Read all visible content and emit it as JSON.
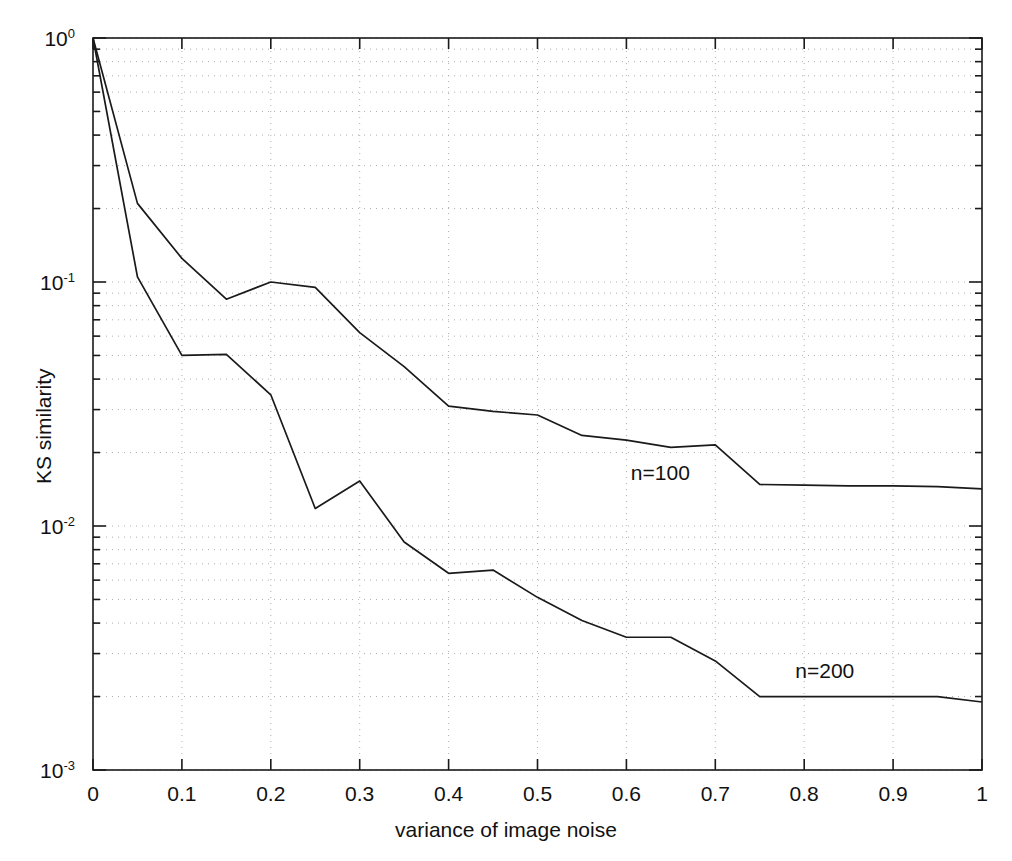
{
  "chart_data": {
    "type": "line",
    "title": "",
    "xlabel": "variance of image noise",
    "ylabel": "KS similarity",
    "xscale": "linear",
    "yscale": "log",
    "xlim": [
      0,
      1
    ],
    "ylim": [
      0.001,
      1
    ],
    "grid": "dotted minor and major log grid",
    "legend_position": "inline annotations on curves",
    "xticks": [
      "0",
      "0.1",
      "0.2",
      "0.3",
      "0.4",
      "0.5",
      "0.6",
      "0.7",
      "0.8",
      "0.9",
      "1"
    ],
    "xtick_values": [
      0,
      0.1,
      0.2,
      0.3,
      0.4,
      0.5,
      0.6,
      0.7,
      0.8,
      0.9,
      1
    ],
    "yticks": [
      "10^0",
      "10^-1",
      "10^-2",
      "10^-3"
    ],
    "ytick_values": [
      1,
      0.1,
      0.01,
      0.001
    ],
    "ytick_mantissa": [
      "10",
      "10",
      "10",
      "10"
    ],
    "ytick_exponent": [
      "0",
      "-1",
      "-2",
      "-3"
    ],
    "x": [
      0,
      0.05,
      0.1,
      0.15,
      0.2,
      0.25,
      0.3,
      0.35,
      0.4,
      0.45,
      0.5,
      0.55,
      0.6,
      0.65,
      0.7,
      0.75,
      0.8,
      0.85,
      0.9,
      0.95,
      1
    ],
    "series": [
      {
        "name": "n=100",
        "label": "n=100",
        "values": [
          1.0,
          0.21,
          0.125,
          0.085,
          0.1,
          0.095,
          0.062,
          0.045,
          0.031,
          0.0295,
          0.0285,
          0.0235,
          0.0225,
          0.021,
          0.0215,
          0.0148,
          0.0147,
          0.0146,
          0.0146,
          0.0145,
          0.0142
        ],
        "annotation_x": 0.605,
        "annotation_y": 0.0165
      },
      {
        "name": "n=200",
        "label": "n=200",
        "values": [
          1.0,
          0.105,
          0.05,
          0.0505,
          0.0345,
          0.0118,
          0.0153,
          0.0086,
          0.0064,
          0.0066,
          0.0051,
          0.0041,
          0.0035,
          0.0035,
          0.0028,
          0.002,
          0.002,
          0.002,
          0.002,
          0.002,
          0.0019
        ],
        "annotation_x": 0.79,
        "annotation_y": 0.00255
      }
    ]
  },
  "figure": {
    "background_color": "#ffffff",
    "axis_color": "#1a1a1a",
    "grid_color": "#b0b0b0",
    "line_color": "#1a1a1a"
  }
}
